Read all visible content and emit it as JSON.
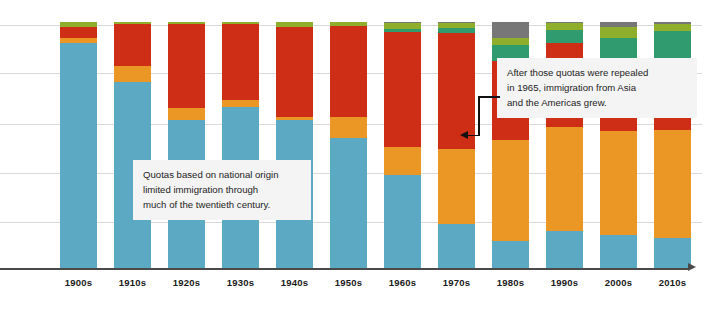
{
  "chart_data": {
    "type": "bar",
    "subtype": "stacked-100-percent",
    "title": "",
    "subtitle": "",
    "xlabel": "",
    "ylabel": "",
    "ylim": [
      0,
      100
    ],
    "grid": true,
    "gridline_count": 5,
    "legend": "none",
    "categories": [
      "1900s",
      "1910s",
      "1920s",
      "1930s",
      "1940s",
      "1950s",
      "1960s",
      "1970s",
      "1980s",
      "1990s",
      "2000s",
      "2010s"
    ],
    "series": [
      {
        "name": "Europe",
        "color": "#5ca9c4",
        "values": [
          91.5,
          75.5,
          60.0,
          65.5,
          60.0,
          53.0,
          38.0,
          18.0,
          11.0,
          13.5,
          13.5,
          12.0
        ]
      },
      {
        "name": "Canada and other North America",
        "color": "#eb9725",
        "values": [
          2.0,
          6.5,
          5.0,
          3.0,
          1.5,
          8.5,
          11.0,
          30.5,
          41.0,
          38.0,
          42.0,
          44.0
        ]
      },
      {
        "name": "Latin America and the Caribbean",
        "color": "#cf2e16",
        "values": [
          4.5,
          17.0,
          34.0,
          30.5,
          36.5,
          37.0,
          47.0,
          47.0,
          32.0,
          31.0,
          24.0,
          26.5
        ]
      },
      {
        "name": "Asia",
        "color": "#2f9b6e",
        "values": [
          0.0,
          0.0,
          0.0,
          0.0,
          0.0,
          0.0,
          1.0,
          2.0,
          6.5,
          4.5,
          14.0,
          14.0
        ]
      },
      {
        "name": "Africa",
        "color": "#8fae2c",
        "values": [
          2.0,
          1.0,
          1.0,
          1.0,
          2.0,
          1.5,
          2.5,
          2.0,
          3.0,
          2.5,
          4.5,
          2.5
        ]
      },
      {
        "name": "Oceania and other",
        "color": "#777777",
        "values": [
          0.0,
          0.0,
          0.0,
          0.0,
          0.0,
          0.0,
          0.5,
          0.5,
          6.5,
          0.5,
          2.0,
          1.0
        ]
      }
    ],
    "annotations": [
      {
        "id": "quotas",
        "text": "Quotas based on national origin\nlimited immigration through\nmuch of the twentieth century."
      },
      {
        "id": "repealed",
        "text": "After those quotas were repealed\nin 1965, immigration from Asia\nand the Americas grew.",
        "points_to": "1970s"
      }
    ],
    "axis": {
      "baseline_color": "#4a4a4a",
      "gridline_color": "#b9b9b9",
      "has_end_arrow": true
    }
  }
}
